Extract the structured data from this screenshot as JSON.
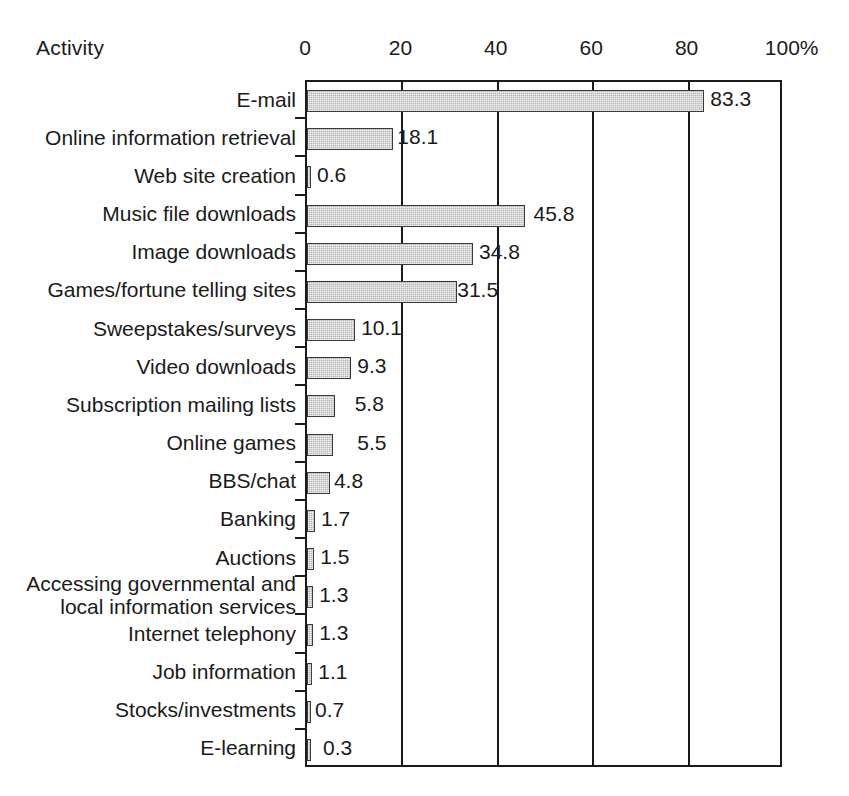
{
  "chart": {
    "axis_title": "Activity",
    "x_unit_suffix": "%"
  },
  "chart_data": {
    "type": "bar",
    "orientation": "horizontal",
    "title": "",
    "xlabel": "",
    "ylabel": "Activity",
    "xlim": [
      0,
      100
    ],
    "xticks": [
      "0",
      "20",
      "40",
      "60",
      "80",
      "100%"
    ],
    "xtick_values": [
      0,
      20,
      40,
      60,
      80,
      100
    ],
    "grid": "vertical",
    "legend": "none",
    "categories": [
      "E-mail",
      "Online information retrieval",
      "Web site creation",
      "Music file downloads",
      "Image downloads",
      "Games/fortune telling sites",
      "Sweepstakes/surveys",
      "Video downloads",
      "Subscription mailing lists",
      "Online games",
      "BBS/chat",
      "Banking",
      "Auctions",
      "Accessing governmental and local information services",
      "Internet telephony",
      "Job information",
      "Stocks/investments",
      "E-learning"
    ],
    "values": [
      83.3,
      18.1,
      0.6,
      45.8,
      34.8,
      31.5,
      10.1,
      9.3,
      5.8,
      5.5,
      4.8,
      1.7,
      1.5,
      1.3,
      1.3,
      1.1,
      0.7,
      0.3
    ],
    "value_labels": [
      "83.3",
      "18.1",
      "0.6",
      "45.8",
      "34.8",
      "31.5",
      "10.1",
      "9.3",
      "5.8",
      "5.5",
      "4.8",
      "1.7",
      "1.5",
      "1.3",
      "1.3",
      "1.1",
      "0.7",
      "0.3"
    ],
    "label_gap_px": [
      8,
      6,
      8,
      10,
      8,
      2,
      8,
      8,
      22,
      26,
      6,
      8,
      8,
      8,
      8,
      8,
      6,
      14
    ],
    "two_line_categories": [
      "Accessing governmental and local information services"
    ],
    "two_line_display": [
      "Accessing governmental and",
      "local information services"
    ],
    "colors": {
      "bar_fill": "#b4b4b4",
      "bar_border": "#3a3a3a",
      "axis": "#1a1a1a",
      "text": "#1a1a1a",
      "background": "#ffffff"
    }
  }
}
